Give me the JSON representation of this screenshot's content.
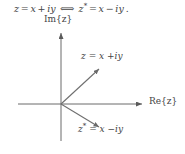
{
  "figure": {
    "background_color": "#ffffff",
    "ink_color": "#555555",
    "text_color": "#444444",
    "width": 185,
    "height": 154
  },
  "equation": {
    "full": "z = x + iy  ⟺  z* = x − iy.",
    "lhs_var": "z",
    "equals": "=",
    "lhs_real": "x",
    "plus": "+",
    "lhs_imag": "iy",
    "iff_symbol": "⟺",
    "rhs_var": "z",
    "rhs_star": "*",
    "rhs_real": "x",
    "minus": "−",
    "rhs_imag": "iy",
    "period": "."
  },
  "axes": {
    "imaginary_label": "Im{z}",
    "real_label": "Re{z}",
    "origin": {
      "x": 61,
      "y": 104
    },
    "vertical": {
      "x": 61,
      "top": 30,
      "bottom": 141
    },
    "horizontal": {
      "y": 104,
      "left": 18,
      "right": 146
    }
  },
  "vectors": [
    {
      "name": "z",
      "label": "z = x + iy",
      "label_var": "z",
      "label_equals": "=",
      "label_real": "x",
      "label_sign": "+",
      "label_imag": "iy",
      "from": {
        "x": 61,
        "y": 104
      },
      "to": {
        "x": 101,
        "y": 67
      }
    },
    {
      "name": "z-conjugate",
      "label": "z* = x − iy",
      "label_var": "z",
      "label_star": "*",
      "label_equals": "=",
      "label_real": "x",
      "label_sign": "−",
      "label_imag": "iy",
      "from": {
        "x": 61,
        "y": 104
      },
      "to": {
        "x": 101,
        "y": 129
      }
    }
  ]
}
